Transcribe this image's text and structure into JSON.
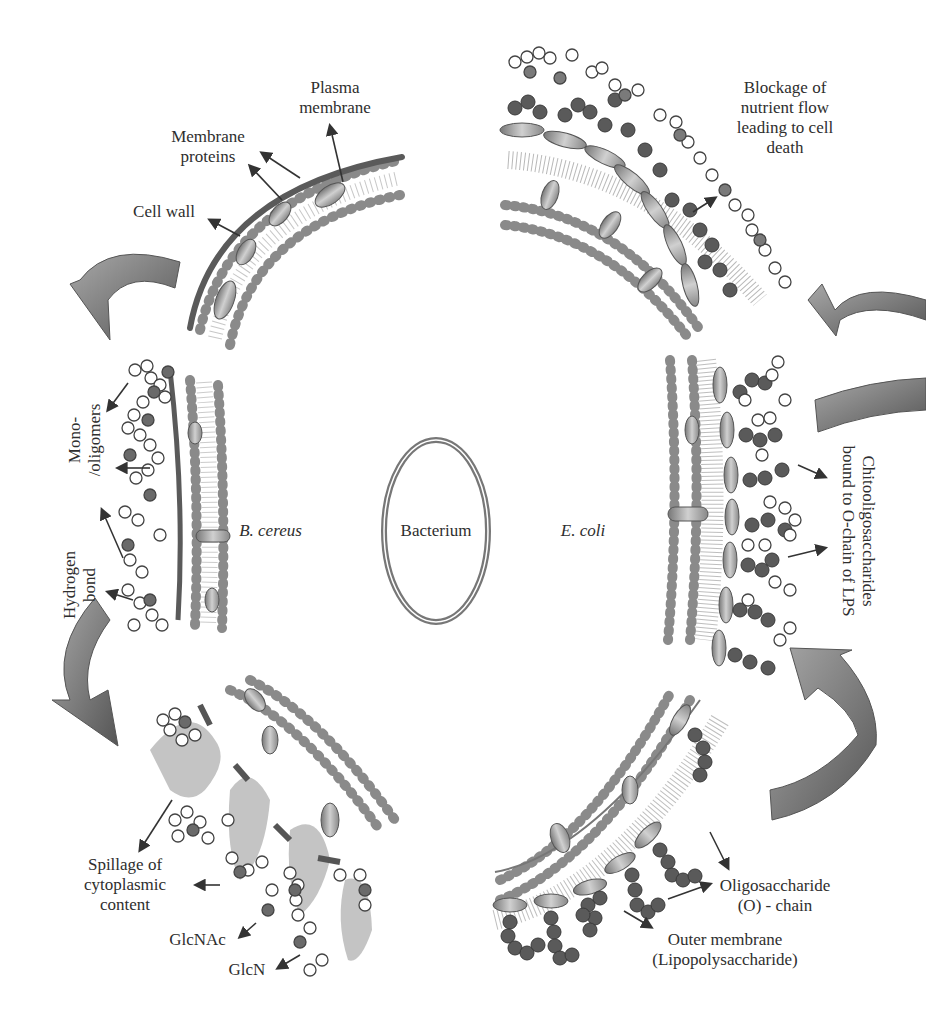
{
  "figure": {
    "center": {
      "label": "Bacterium"
    },
    "organisms": {
      "gram_positive": "B. cereus",
      "gram_negative": "E. coli"
    },
    "labels": {
      "plasma_membrane": [
        "Plasma",
        "membrane"
      ],
      "membrane_proteins": [
        "Membrane",
        "proteins"
      ],
      "cell_wall": "Cell wall",
      "mono_oligomers": [
        "Mono-",
        "/oligomers"
      ],
      "hydrogen_bond": [
        "Hydrogen",
        "bond"
      ],
      "spillage": [
        "Spillage of",
        "cytoplasmic",
        "content"
      ],
      "glcnac": "GlcNAc",
      "glcn": "GlcN",
      "blockage": [
        "Blockage of",
        "nutrient flow",
        "leading to cell",
        "death"
      ],
      "chitooligosaccharides": [
        "Chitooligosaccharides",
        "bound to O-chain of LPS"
      ],
      "oligosaccharide": [
        "Oligosaccharide",
        "(O) - chain"
      ],
      "outer_membrane": [
        "Outer membrane",
        "(Lipopolysaccharide)"
      ]
    },
    "colors": {
      "background": "#ffffff",
      "text": "#2e2e2e",
      "cell_wall": "#555555",
      "lipid_head": "#8a8a8a",
      "protein": "#a8a8a8",
      "arrow_fill": "#8c8c8c",
      "cytoplasm_spill": "#c4c4c4",
      "sugar_dark": "#5a5a5a",
      "sugar_light": "#ffffff"
    }
  }
}
